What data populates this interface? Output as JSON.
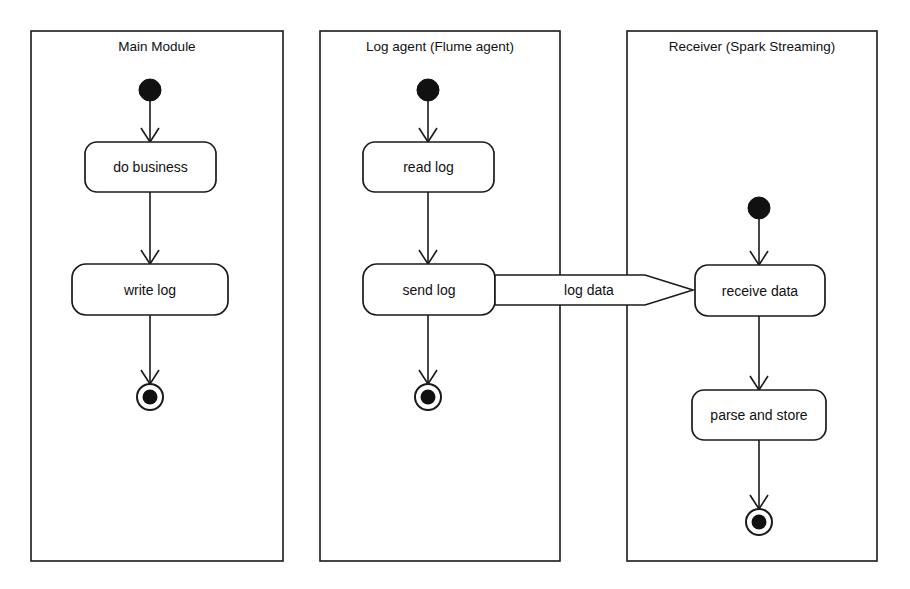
{
  "diagram": {
    "type": "uml-activity-diagram",
    "background_color": "#ffffff",
    "line_color": "#1a1a1a",
    "text_color": "#111111"
  },
  "partitions": [
    {
      "id": "main-module",
      "label": "Main Module",
      "x": 31,
      "y": 31,
      "width": 252,
      "height": 530,
      "title_x": 157,
      "title_y": 47
    },
    {
      "id": "log-agent",
      "label": "Log agent (Flume agent)",
      "x": 320,
      "y": 31,
      "width": 240,
      "height": 530,
      "title_x": 440,
      "title_y": 47
    },
    {
      "id": "receiver",
      "label": "Receiver (Spark Streaming)",
      "x": 627,
      "y": 31,
      "width": 250,
      "height": 530,
      "title_x": 752,
      "title_y": 47
    }
  ],
  "initial_nodes": [
    {
      "id": "initial-main",
      "cx": 150,
      "cy": 90,
      "r": 11
    },
    {
      "id": "initial-log-agent",
      "cx": 428,
      "cy": 90,
      "r": 11
    },
    {
      "id": "initial-receiver",
      "cx": 759,
      "cy": 208,
      "r": 11
    }
  ],
  "actions": [
    {
      "id": "do-business",
      "label": "do business",
      "x": 85,
      "y": 142,
      "width": 131,
      "height": 50,
      "rx": 12,
      "label_x": 150.5,
      "label_y": 167
    },
    {
      "id": "write-log",
      "label": "write log",
      "x": 72,
      "y": 264,
      "width": 156,
      "height": 51,
      "rx": 14,
      "label_x": 150,
      "label_y": 290
    },
    {
      "id": "read-log",
      "label": "read log",
      "x": 363,
      "y": 142,
      "width": 131,
      "height": 50,
      "rx": 12,
      "label_x": 428.5,
      "label_y": 167
    },
    {
      "id": "send-log",
      "label": "send log",
      "x": 363,
      "y": 264,
      "width": 132,
      "height": 51,
      "rx": 14,
      "label_x": 429,
      "label_y": 290
    },
    {
      "id": "receive-data",
      "label": "receive data",
      "x": 695,
      "y": 265,
      "width": 130,
      "height": 51,
      "rx": 13,
      "label_x": 760,
      "label_y": 291
    },
    {
      "id": "parse-and-store",
      "label": "parse and store",
      "x": 692,
      "y": 390,
      "width": 134,
      "height": 50,
      "rx": 12,
      "label_x": 759,
      "label_y": 415
    }
  ],
  "final_nodes": [
    {
      "id": "final-main",
      "cx": 150,
      "cy": 397,
      "r_outer": 13,
      "r_inner": 7.5
    },
    {
      "id": "final-log-agent",
      "cx": 428,
      "cy": 397,
      "r_outer": 13,
      "r_inner": 7.5
    },
    {
      "id": "final-receiver",
      "cx": 759,
      "cy": 522,
      "r_outer": 13,
      "r_inner": 7.5
    }
  ],
  "flows": [
    {
      "id": "flow-initial-to-do-business",
      "from": "initial-main",
      "to": "do-business",
      "x": 150,
      "y1": 101,
      "y2": 142
    },
    {
      "id": "flow-do-business-to-write-log",
      "from": "do-business",
      "to": "write-log",
      "x": 150,
      "y1": 192,
      "y2": 264
    },
    {
      "id": "flow-write-log-to-final",
      "from": "write-log",
      "to": "final-main",
      "x": 150,
      "y1": 315,
      "y2": 384
    },
    {
      "id": "flow-initial-to-read-log",
      "from": "initial-log-agent",
      "to": "read-log",
      "x": 428,
      "y1": 101,
      "y2": 142
    },
    {
      "id": "flow-read-log-to-send-log",
      "from": "read-log",
      "to": "send-log",
      "x": 428,
      "y1": 192,
      "y2": 264
    },
    {
      "id": "flow-send-log-to-final",
      "from": "send-log",
      "to": "final-log-agent",
      "x": 428,
      "y1": 315,
      "y2": 384
    },
    {
      "id": "flow-initial-to-receive-data",
      "from": "initial-receiver",
      "to": "receive-data",
      "x": 759,
      "y1": 219,
      "y2": 265
    },
    {
      "id": "flow-receive-data-to-parse",
      "from": "receive-data",
      "to": "parse-and-store",
      "x": 759,
      "y1": 316,
      "y2": 390
    },
    {
      "id": "flow-parse-to-final",
      "from": "parse-and-store",
      "to": "final-receiver",
      "x": 759,
      "y1": 440,
      "y2": 509
    }
  ],
  "signal_flow": {
    "id": "log-data-signal",
    "label": "log data",
    "from": "send-log",
    "to": "receive-data",
    "x_start": 495,
    "x_body_end": 645,
    "x_tip": 693,
    "y_top": 275,
    "y_bottom": 305,
    "label_x": 589,
    "label_y": 291
  }
}
